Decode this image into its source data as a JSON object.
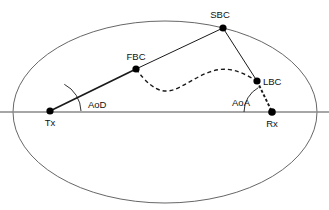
{
  "figure": {
    "type": "propagation-geometry-diagram",
    "background_color": "#ffffff"
  },
  "colors": {
    "ellipse_stroke": "#555555",
    "axis_stroke": "#888888",
    "path_stroke": "#1a1a1a",
    "dashed_stroke": "#1a1a1a",
    "node_fill": "#000000",
    "text": "#111111"
  },
  "ellipse": {
    "name": "scattering-region-ellipse",
    "cx": 165,
    "cy": 112,
    "rx": 152,
    "ry": 91,
    "stroke_width": 0.9
  },
  "axis": {
    "name": "horizontal-reference-axis",
    "x1": 0,
    "y1": 112,
    "x2": 329,
    "y2": 112,
    "stroke_width": 1.6
  },
  "nodes": [
    {
      "id": "tx",
      "label": "Tx",
      "x": 50,
      "y": 111,
      "r": 3.6,
      "label_x": 50,
      "label_y": 126,
      "label_anchor": "middle"
    },
    {
      "id": "fbc",
      "label": "FBC",
      "x": 136,
      "y": 69,
      "r": 3.6,
      "label_x": 136,
      "label_y": 60,
      "label_anchor": "middle"
    },
    {
      "id": "sbc",
      "label": "SBC",
      "x": 223,
      "y": 28,
      "r": 3.6,
      "label_x": 220,
      "label_y": 18,
      "label_anchor": "middle"
    },
    {
      "id": "lbc",
      "label": "LBC",
      "x": 257,
      "y": 81,
      "r": 3.6,
      "label_x": 263,
      "label_y": 85,
      "label_anchor": "start"
    },
    {
      "id": "rx",
      "label": "Rx",
      "x": 272,
      "y": 112,
      "r": 3.8,
      "label_x": 272,
      "label_y": 127,
      "label_anchor": "middle"
    }
  ],
  "paths": [
    {
      "name": "path-tx-to-fbc",
      "style": "solid",
      "stroke_width": 1.7,
      "d": "M 50 111 L 136 69"
    },
    {
      "name": "path-fbc-to-sbc",
      "style": "solid",
      "stroke_width": 1.0,
      "d": "M 136 69 L 223 28"
    },
    {
      "name": "path-sbc-to-lbc",
      "style": "solid",
      "stroke_width": 1.0,
      "d": "M 223 28 L 257 81"
    },
    {
      "name": "path-lbc-to-rx",
      "style": "dashed",
      "stroke_width": 1.9,
      "dash": "3,2",
      "d": "M 257 81 L 272 112"
    },
    {
      "name": "path-fbc-to-lbc-cluster-curve",
      "style": "dashed",
      "stroke_width": 1.4,
      "dash": "4,3",
      "d": "M 136 69 C 156 96 168 93 180 87 C 196 79 212 66 232 70 C 242 72 250 77 257 81"
    }
  ],
  "angles": [
    {
      "name": "angle-of-departure",
      "label": "AoD",
      "vertex_x": 50,
      "vertex_y": 111,
      "radius": 31,
      "arc_d": "M 81 111 A 31 31 0 0 0 64.3 84.3",
      "label_x": 88,
      "label_y": 108
    },
    {
      "name": "angle-of-arrival",
      "label": "AoA",
      "vertex_x": 272,
      "vertex_y": 112,
      "radius": 28,
      "arc_d": "M 244 112 A 28 28 0 0 1 258.4 87.6",
      "label_x": 241,
      "label_y": 106
    }
  ]
}
